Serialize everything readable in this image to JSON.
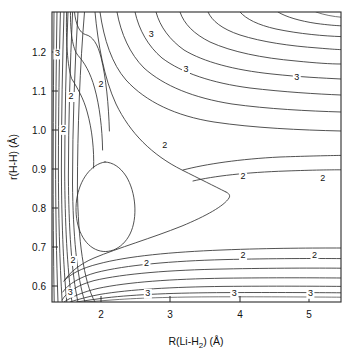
{
  "figure": {
    "kind": "contour-plot",
    "width": 356,
    "height": 363,
    "background": "#ffffff",
    "line_color": "#333333",
    "frame_color": "#2b2b2b"
  },
  "chart_data": {
    "type": "line",
    "subtype": "contour",
    "title": "",
    "subtitle": "",
    "xlabel": "R(Li-H",
    "xlabel_sub": "2",
    "xlabel_tail": ") (Å)",
    "xlabel_full": "R(Li-H2) (Å)",
    "ylabel": "r(H-H) (Å)",
    "xlim": [
      1.25,
      5.5
    ],
    "ylim": [
      0.55,
      1.3
    ],
    "grid": false,
    "legend": null,
    "xticks": [
      2,
      3,
      4,
      5
    ],
    "xtick_labels": [
      "2",
      "3",
      "4",
      "5"
    ],
    "yticks": [
      0.6,
      0.7,
      0.8,
      0.9,
      1.0,
      1.1,
      1.2
    ],
    "ytick_labels": [
      "0.6",
      "0.7",
      "0.8",
      "0.9",
      "1.0",
      "1.1",
      "1.2"
    ],
    "contour_labels": [
      {
        "text": "3",
        "x": 1.33,
        "y": 1.185
      },
      {
        "text": "2",
        "x": 1.53,
        "y": 1.075
      },
      {
        "text": "2",
        "x": 1.42,
        "y": 0.99
      },
      {
        "text": "3",
        "x": 2.71,
        "y": 1.235
      },
      {
        "text": "2",
        "x": 1.97,
        "y": 1.105
      },
      {
        "text": "3",
        "x": 3.22,
        "y": 1.145
      },
      {
        "text": "3",
        "x": 4.85,
        "y": 1.125
      },
      {
        "text": "2",
        "x": 2.91,
        "y": 0.948
      },
      {
        "text": "2",
        "x": 4.06,
        "y": 0.867
      },
      {
        "text": "2",
        "x": 5.23,
        "y": 0.862
      },
      {
        "text": "2",
        "x": 1.56,
        "y": 0.651
      },
      {
        "text": "2",
        "x": 2.64,
        "y": 0.642
      },
      {
        "text": "2",
        "x": 4.06,
        "y": 0.664
      },
      {
        "text": "2",
        "x": 5.11,
        "y": 0.665
      },
      {
        "text": "3",
        "x": 1.52,
        "y": 0.569
      },
      {
        "text": "3",
        "x": 2.66,
        "y": 0.566
      },
      {
        "text": "3",
        "x": 3.93,
        "y": 0.566
      },
      {
        "text": "3",
        "x": 5.05,
        "y": 0.566
      }
    ]
  }
}
